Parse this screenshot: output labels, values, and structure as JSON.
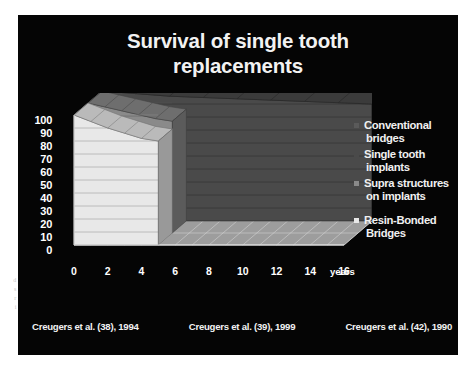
{
  "slide": {
    "title_lines": [
      "Survival of single tooth",
      "replacements"
    ],
    "background_color": "#050505",
    "text_color": "#f2f2f2"
  },
  "legend": {
    "items": [
      {
        "label_lines": [
          "Conventional",
          "bridges"
        ],
        "color": "#5a5a5a",
        "name": "conventional-bridges"
      },
      {
        "label_lines": [
          "Single tooth",
          "implants"
        ],
        "color": "#4a4a4a",
        "name": "single-tooth-implants"
      },
      {
        "label_lines": [
          "Supra structures",
          "on implants"
        ],
        "color": "#8a8a8a",
        "name": "supra-structures-on-implants"
      },
      {
        "label_lines": [
          "Resin-Bonded",
          "Bridges"
        ],
        "color": "#e8e8e8",
        "name": "resin-bonded-bridges"
      }
    ]
  },
  "citations": [
    "Creugers et al. (38), 1994",
    "Creugers et al. (39), 1999",
    "Creugers et al. (42), 1990"
  ],
  "margin_artifacts": [
    "d",
    "s",
    "r",
    "i"
  ],
  "chart_data": {
    "type": "area",
    "render": "3d-stacked-ribbon",
    "title": "Survival of single tooth replacements",
    "xlabel": "years",
    "ylabel": "",
    "x_unit_label": "years",
    "xlim": [
      0,
      16
    ],
    "ylim": [
      0,
      100
    ],
    "xticks": [
      0,
      2,
      4,
      6,
      8,
      10,
      12,
      14,
      16
    ],
    "yticks": [
      0,
      10,
      20,
      30,
      40,
      50,
      60,
      70,
      80,
      90,
      100
    ],
    "grid": true,
    "grid_axis": "y",
    "legend_position": "right",
    "series": [
      {
        "name": "Conventional bridges",
        "color": "#5a5a5a",
        "depth_index": 0,
        "x": [
          0,
          2,
          4,
          6,
          8,
          10,
          12,
          14,
          16
        ],
        "values": [
          100,
          99,
          98,
          97,
          96,
          95,
          94,
          93,
          92
        ]
      },
      {
        "name": "Single tooth implants",
        "color": "#4a4a4a",
        "depth_index": 1,
        "x": [
          0,
          2,
          4,
          6,
          8,
          10,
          12,
          14,
          16
        ],
        "values": [
          100,
          98,
          96,
          95,
          94,
          93,
          92,
          91,
          90
        ]
      },
      {
        "name": "Supra structures on implants",
        "color": "#8a8a8a",
        "depth_index": 2,
        "x": [
          0,
          1,
          2,
          3,
          4,
          5
        ],
        "values": [
          100,
          97,
          94,
          91,
          88,
          86
        ]
      },
      {
        "name": "Resin-Bonded Bridges",
        "color": "#e8e8e8",
        "depth_index": 3,
        "x": [
          0,
          1,
          2,
          3,
          4,
          5
        ],
        "values": [
          100,
          95,
          90,
          86,
          82,
          80
        ]
      }
    ]
  }
}
